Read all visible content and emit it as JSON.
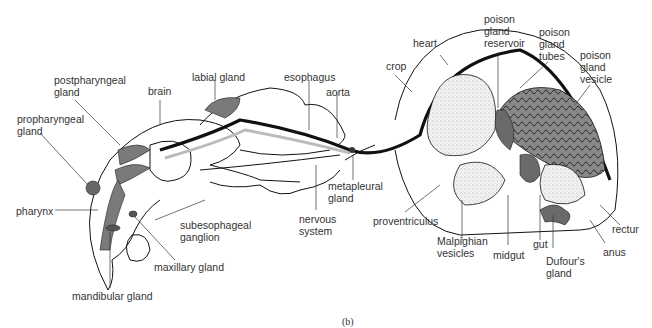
{
  "figure": {
    "type": "anatomical diagram",
    "caption": "(b)",
    "colors": {
      "outline": "#111111",
      "gland_fill": "#7a7a7a",
      "stipple_fill": "#e8e8e8",
      "background": "#ffffff",
      "text": "#333333"
    }
  },
  "labels": {
    "postpharyngeal_gland": "postpharyngeal\ngland",
    "propharyngeal_gland": "propharyngeal\ngland",
    "brain": "brain",
    "labial_gland": "labial gland",
    "esophagus": "esophagus",
    "aorta": "aorta",
    "crop": "crop",
    "heart": "heart",
    "poison_gland_reservoir": "poison\ngland\nreservoir",
    "poison_gland_tubes": "poison\ngland\ntubes",
    "poison_gland_vesicle": "poison\ngland\nvesicle",
    "pharynx": "pharynx",
    "subesophageal_ganglion": "subesophageal\nganglion",
    "maxillary_gland": "maxillary gland",
    "mandibular_gland": "mandibular gland",
    "nervous_system": "nervous\nsystem",
    "metapleural_gland": "metapleural\ngland",
    "proventriculus": "proventriculus",
    "malpighian_vesicles": "Malpighian\nvesicles",
    "midgut": "midgut",
    "gut": "gut",
    "dufours_gland": "Dufour's\ngland",
    "rectum": "rectur",
    "anus": "anus"
  }
}
